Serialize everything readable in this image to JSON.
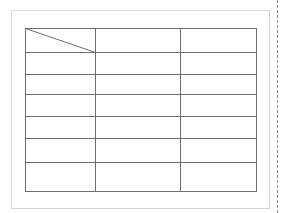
{
  "document": {
    "table": {
      "columns": 3,
      "rows": 7,
      "header_cell_diagonal": true,
      "cells": [
        [
          "",
          "",
          ""
        ],
        [
          "",
          "",
          ""
        ],
        [
          "",
          "",
          ""
        ],
        [
          "",
          "",
          ""
        ],
        [
          "",
          "",
          ""
        ],
        [
          "",
          "",
          ""
        ],
        [
          "",
          "",
          ""
        ]
      ]
    },
    "colors": {
      "table_border": "#6e6e6e",
      "page_frame": "#d8d8d8",
      "margin_guide": "#8a8a8a"
    }
  }
}
